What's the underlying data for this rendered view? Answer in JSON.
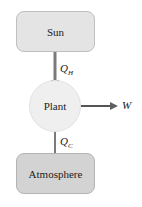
{
  "diagram": {
    "type": "heat-engine-flow",
    "nodes": [
      {
        "id": "sun",
        "label": "Sun",
        "shape": "rounded-rect",
        "fill": "#e4e4e4"
      },
      {
        "id": "plant",
        "label": "Plant",
        "shape": "circle",
        "fill": "#efefef"
      },
      {
        "id": "atmosphere",
        "label": "Atmosphere",
        "shape": "rounded-rect",
        "fill": "#d3d3d3"
      }
    ],
    "edges": [
      {
        "from": "sun",
        "to": "plant",
        "label_main": "Q",
        "label_sub": "H"
      },
      {
        "from": "plant",
        "to": "atmosphere",
        "label_main": "Q",
        "label_sub": "C"
      },
      {
        "from": "plant",
        "to": "W",
        "label_main": "W"
      }
    ],
    "arrow_color": "#6e6e6e"
  },
  "labels": {
    "sun": "Sun",
    "plant": "Plant",
    "atmosphere": "Atmosphere",
    "qh_main": "Q",
    "qh_sub": "H",
    "qc_main": "Q",
    "qc_sub": "C",
    "work": "W"
  }
}
